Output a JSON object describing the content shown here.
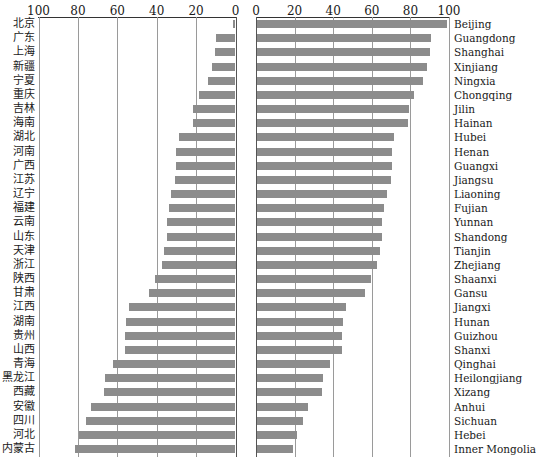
{
  "chart_data": {
    "type": "bar",
    "orientation": "horizontal",
    "layout": "mirrored two-panel (left panel axis reversed 100→0, right panel axis 0→100)",
    "title": "",
    "grid": true,
    "categories_cn": [
      "北京",
      "广东",
      "上海",
      "新疆",
      "宁夏",
      "重庆",
      "吉林",
      "海南",
      "湖北",
      "河南",
      "广西",
      "江苏",
      "辽宁",
      "福建",
      "云南",
      "山东",
      "天津",
      "浙江",
      "陕西",
      "甘肃",
      "江西",
      "湖南",
      "贵州",
      "山西",
      "青海",
      "黑龙江",
      "西藏",
      "安徽",
      "四川",
      "河北",
      "内蒙古"
    ],
    "categories": [
      "Beijing",
      "Guangdong",
      "Shanghai",
      "Xinjiang",
      "Ningxia",
      "Chongqing",
      "Jilin",
      "Hainan",
      "Hubei",
      "Henan",
      "Guangxi",
      "Jiangsu",
      "Liaoning",
      "Fujian",
      "Yunnan",
      "Shandong",
      "Tianjin",
      "Zhejiang",
      "Shaanxi",
      "Gansu",
      "Jiangxi",
      "Hunan",
      "Guizhou",
      "Shanxi",
      "Qinghai",
      "Heilongjiang",
      "Xizang",
      "Anhui",
      "Sichuan",
      "Hebei",
      "Inner Mongolia"
    ],
    "series": [
      {
        "name": "left",
        "values": [
          1.5,
          10,
          10.5,
          12,
          14,
          18.5,
          21.5,
          21.5,
          28.5,
          30,
          30,
          30.5,
          32.5,
          34,
          35,
          35,
          36.5,
          37.5,
          41,
          44,
          54,
          55.5,
          56,
          56,
          62,
          66,
          66.5,
          73.5,
          76,
          79.5,
          81.5
        ]
      },
      {
        "name": "right",
        "values": [
          98.5,
          90,
          89.5,
          88,
          86,
          81.5,
          78.5,
          78,
          71,
          70,
          70,
          69.5,
          67.5,
          66,
          65,
          65,
          63.5,
          62,
          59,
          56,
          46,
          44.5,
          44,
          44,
          38,
          34,
          33.5,
          26.5,
          24,
          20.5,
          18.5
        ]
      }
    ],
    "left_axis": {
      "ticks": [
        "100",
        "80",
        "60",
        "40",
        "20",
        "0"
      ],
      "range": [
        100,
        0
      ]
    },
    "right_axis": {
      "ticks": [
        "0",
        "20",
        "40",
        "60",
        "80",
        "100"
      ],
      "range": [
        0,
        100
      ]
    },
    "xlabel": "",
    "ylabel": "",
    "bar_color": "#8c8c8c"
  }
}
